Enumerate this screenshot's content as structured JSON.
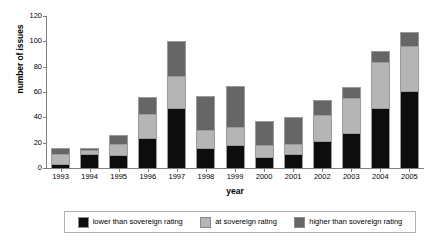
{
  "chart_data": {
    "type": "bar",
    "title": "",
    "subtitle": "",
    "xlabel": "year",
    "ylabel": "number of issues",
    "stacked": true,
    "grid": false,
    "legend_position": "bottom",
    "ylim": [
      0,
      120
    ],
    "yticks": [
      0,
      20,
      40,
      60,
      80,
      100,
      120
    ],
    "categories": [
      "1993",
      "1994",
      "1995",
      "1996",
      "1997",
      "1998",
      "1999",
      "2000",
      "2001",
      "2002",
      "2003",
      "2004",
      "2005"
    ],
    "series": [
      {
        "name": "lower than sovereign rating",
        "color": "#0d0d0d",
        "values": [
          3,
          11,
          10,
          24,
          47,
          16,
          18,
          9,
          11,
          21,
          28,
          47,
          61
        ]
      },
      {
        "name": "at sovereign rating",
        "color": "#b5b5b5",
        "values": [
          8,
          3,
          9,
          19,
          26,
          14,
          14,
          9,
          8,
          21,
          27,
          37,
          35
        ]
      },
      {
        "name": "higher than sovereign rating",
        "color": "#666666",
        "values": [
          5,
          2,
          7,
          13,
          27,
          27,
          33,
          19,
          21,
          12,
          9,
          8,
          11
        ]
      }
    ],
    "totals": [
      16,
      16,
      26,
      56,
      100,
      57,
      65,
      37,
      40,
      54,
      64,
      92,
      107
    ]
  },
  "axes": {
    "y_title": "number of issues",
    "x_title": "year",
    "y_tick_labels": [
      "0",
      "20",
      "40",
      "60",
      "80",
      "100",
      "120"
    ],
    "x_tick_labels": [
      "1993",
      "1994",
      "1995",
      "1996",
      "1997",
      "1998",
      "1999",
      "2000",
      "2001",
      "2002",
      "2003",
      "2004",
      "2005"
    ]
  },
  "legend": {
    "entries": [
      {
        "label": "lower than sovereign rating",
        "color": "#0d0d0d"
      },
      {
        "label": "at sovereign rating",
        "color": "#b5b5b5"
      },
      {
        "label": "higher than sovereign rating",
        "color": "#666666"
      }
    ]
  },
  "colors": {
    "background": "#ffffff",
    "axis": "#808080",
    "text": "#000000",
    "legend_border": "#b0b0b0",
    "bar_outline": "#9a9a9a"
  }
}
